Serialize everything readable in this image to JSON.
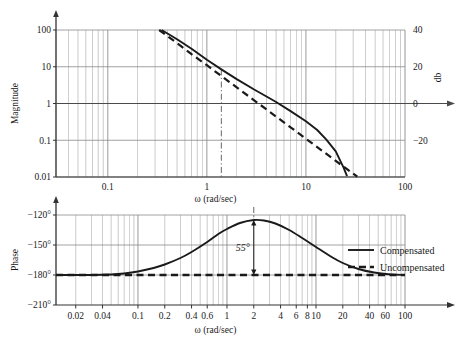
{
  "chart_data": [
    {
      "type": "line",
      "title": "",
      "id": "magnitude-plot",
      "xlabel": "ω (rad/sec)",
      "ylabel": "Magnitude",
      "ylabel_right": "db",
      "xscale": "log",
      "yscale": "log",
      "xlim": [
        0.03,
        100
      ],
      "ylim": [
        0.01,
        100
      ],
      "xticks": [
        0.1,
        1,
        10,
        100
      ],
      "xticklabels": [
        "0.1",
        "1",
        "10",
        "100"
      ],
      "yticks": [
        0.01,
        0.1,
        1,
        10,
        100
      ],
      "yticklabels": [
        "0.01",
        "0.1",
        "1",
        "10",
        "100"
      ],
      "yticks_right": [
        -20,
        0,
        20,
        40
      ],
      "yticklabels_right": [
        "−20",
        "0",
        "20",
        "40"
      ],
      "grid": true,
      "series": [
        {
          "name": "Compensated",
          "style": "solid",
          "points": [
            [
              0.35,
              100
            ],
            [
              0.5,
              56
            ],
            [
              0.7,
              31
            ],
            [
              1.0,
              15.5
            ],
            [
              1.4,
              8.5
            ],
            [
              2.0,
              4.6
            ],
            [
              3.0,
              2.4
            ],
            [
              4.0,
              1.55
            ],
            [
              5.0,
              1.1
            ],
            [
              7.0,
              0.62
            ],
            [
              10.0,
              0.33
            ],
            [
              13.0,
              0.19
            ],
            [
              16.0,
              0.105
            ],
            [
              20.0,
              0.05
            ],
            [
              24.0,
              0.018
            ],
            [
              26.0,
              0.0105
            ]
          ]
        },
        {
          "name": "Uncompensated",
          "style": "dashed",
          "points": [
            [
              0.33,
              100
            ],
            [
              0.5,
              44
            ],
            [
              0.7,
              22
            ],
            [
              1.0,
              11
            ],
            [
              1.4,
              5.6
            ],
            [
              2.0,
              2.75
            ],
            [
              3.0,
              1.22
            ],
            [
              4.0,
              0.69
            ],
            [
              5.0,
              0.44
            ],
            [
              7.0,
              0.225
            ],
            [
              10.0,
              0.11
            ],
            [
              13.0,
              0.065
            ],
            [
              16.0,
              0.043
            ],
            [
              20.0,
              0.0275
            ],
            [
              26.0,
              0.0163
            ],
            [
              33.0,
              0.0102
            ]
          ]
        }
      ],
      "marker_line": {
        "x": 1.4,
        "style": "dash-dot"
      }
    },
    {
      "type": "line",
      "title": "",
      "id": "phase-plot",
      "xlabel": "ω (rad/sec)",
      "ylabel": "Phase",
      "xscale": "log",
      "yscale": "linear",
      "xlim": [
        0.012,
        100
      ],
      "ylim": [
        -210,
        -120
      ],
      "xticks": [
        0.02,
        0.04,
        0.1,
        0.2,
        0.4,
        0.6,
        1,
        2,
        4,
        6,
        8,
        10,
        20,
        40,
        60,
        100
      ],
      "xticklabels": [
        "0.02",
        "0.04",
        "0.1",
        "0.2",
        "0.4",
        "0.6",
        "1",
        "2",
        "4",
        "6",
        "8",
        "10",
        "20",
        "40",
        "60",
        "100"
      ],
      "yticks": [
        -120,
        -150,
        -180,
        -210
      ],
      "yticklabels": [
        "−120°",
        "−150°",
        "−180°",
        "−210°"
      ],
      "grid": true,
      "series": [
        {
          "name": "Compensated",
          "style": "solid",
          "points": [
            [
              0.012,
              -180
            ],
            [
              0.03,
              -180
            ],
            [
              0.05,
              -179.5
            ],
            [
              0.07,
              -178.5
            ],
            [
              0.1,
              -176.5
            ],
            [
              0.15,
              -173
            ],
            [
              0.2,
              -169.5
            ],
            [
              0.3,
              -163
            ],
            [
              0.4,
              -157
            ],
            [
              0.6,
              -147
            ],
            [
              0.8,
              -139
            ],
            [
              1.0,
              -134
            ],
            [
              1.4,
              -128
            ],
            [
              2.0,
              -125
            ],
            [
              2.6,
              -125.5
            ],
            [
              3.5,
              -128.5
            ],
            [
              5.0,
              -135
            ],
            [
              7.0,
              -143
            ],
            [
              10.0,
              -152
            ],
            [
              15.0,
              -162
            ],
            [
              20.0,
              -168
            ],
            [
              30.0,
              -174
            ],
            [
              45.0,
              -177.5
            ],
            [
              70.0,
              -179.4
            ],
            [
              100.0,
              -180
            ]
          ]
        },
        {
          "name": "Uncompensated",
          "style": "dashed",
          "points": [
            [
              0.012,
              -180
            ],
            [
              100,
              -180
            ]
          ]
        }
      ],
      "annotations": [
        {
          "text": "55°",
          "x": 2.0,
          "y_top": -125,
          "y_bottom": -180,
          "type": "double-arrow"
        }
      ],
      "marker_line": {
        "x": 2.0,
        "style": "dash-dot"
      }
    }
  ],
  "legend": {
    "position": "right-middle",
    "entries": [
      {
        "label": "Compensated",
        "style": "solid"
      },
      {
        "label": "Uncompensated",
        "style": "dashed"
      }
    ]
  },
  "colors": {
    "curve": "#1a1a1a",
    "grid": "#8a8a8a",
    "axis": "#333333",
    "background": "#ffffff"
  }
}
